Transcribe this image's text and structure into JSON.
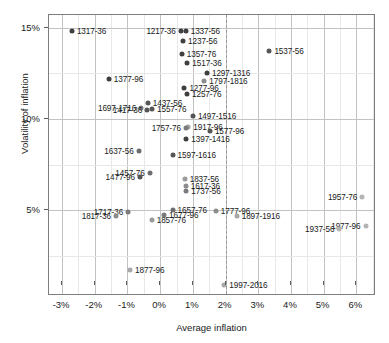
{
  "chart_data": {
    "type": "scatter",
    "title": "",
    "xlabel": "Average inflation",
    "ylabel": "Volatility of inflation",
    "xlim": [
      -3.4,
      6.6
    ],
    "ylim": [
      0.3,
      15.7
    ],
    "xticks": [
      "-3%",
      "-2%",
      "-1%",
      "0%",
      "1%",
      "2%",
      "3%",
      "4%",
      "5%",
      "6%"
    ],
    "xtick_values": [
      -3,
      -2,
      -1,
      0,
      1,
      2,
      3,
      4,
      5,
      6
    ],
    "yticks": [
      "5%",
      "10%",
      "15%"
    ],
    "ytick_values": [
      5,
      10,
      15
    ],
    "grid": true,
    "legend": "none",
    "reference_line": {
      "orientation": "vertical",
      "x": 2,
      "style": "dashed",
      "color": "#9a9a9a"
    },
    "colors": {
      "old_point": "#3f3f3f",
      "mid_point": "#6e6e6e",
      "modern_point": "#b4b4b4"
    },
    "points": [
      {
        "label": "1217-36",
        "x": 0.63,
        "y": 14.85,
        "color": "#3f3f3f",
        "size": 5.0,
        "side": "left"
      },
      {
        "label": "1337-56",
        "x": 0.78,
        "y": 14.85,
        "color": "#3f3f3f",
        "size": 5.0,
        "side": "right"
      },
      {
        "label": "1237-56",
        "x": 0.7,
        "y": 14.25,
        "color": "#3f3f3f",
        "size": 5.0,
        "side": "right"
      },
      {
        "label": "1317-36",
        "x": -2.7,
        "y": 14.85,
        "color": "#3f3f3f",
        "size": 5.0,
        "side": "right"
      },
      {
        "label": "1357-76",
        "x": 0.66,
        "y": 13.55,
        "color": "#3f3f3f",
        "size": 5.0,
        "side": "right"
      },
      {
        "label": "1537-56",
        "x": 3.34,
        "y": 13.75,
        "color": "#555555",
        "size": 5.0,
        "side": "right"
      },
      {
        "label": "1517-36",
        "x": 0.83,
        "y": 13.05,
        "color": "#3f3f3f",
        "size": 5.0,
        "side": "right"
      },
      {
        "label": "1297-1316",
        "x": 1.43,
        "y": 12.5,
        "color": "#3f3f3f",
        "size": 5.0,
        "side": "right"
      },
      {
        "label": "1377-96",
        "x": -1.57,
        "y": 12.2,
        "color": "#3f3f3f",
        "size": 5.0,
        "side": "right"
      },
      {
        "label": "1797-1816",
        "x": 1.35,
        "y": 12.1,
        "color": "#8c8c8c",
        "size": 5.0,
        "side": "right"
      },
      {
        "label": "1277-96",
        "x": 0.74,
        "y": 11.7,
        "color": "#3f3f3f",
        "size": 5.0,
        "side": "right"
      },
      {
        "label": "1257-76",
        "x": 0.82,
        "y": 11.35,
        "color": "#3f3f3f",
        "size": 5.0,
        "side": "right"
      },
      {
        "label": "1437-56",
        "x": -0.38,
        "y": 10.9,
        "color": "#555555",
        "size": 5.0,
        "side": "right"
      },
      {
        "label": "1697-1716",
        "x": -0.58,
        "y": 10.6,
        "color": "#7a7a7a",
        "size": 5.0,
        "side": "left"
      },
      {
        "label": "1557-76",
        "x": -0.25,
        "y": 10.55,
        "color": "#555555",
        "size": 5.0,
        "side": "right"
      },
      {
        "label": "1417-36",
        "x": -0.4,
        "y": 10.5,
        "color": "#555555",
        "size": 5.0,
        "side": "left"
      },
      {
        "label": "1497-1516",
        "x": 1.0,
        "y": 10.15,
        "color": "#555555",
        "size": 5.0,
        "side": "right"
      },
      {
        "label": "1917-96",
        "x": 0.86,
        "y": 9.58,
        "color": "#a0a0a0",
        "size": 5.0,
        "side": "right"
      },
      {
        "label": "1757-76",
        "x": 0.79,
        "y": 9.5,
        "color": "#7a7a7a",
        "size": 5.0,
        "side": "left"
      },
      {
        "label": "1577-96",
        "x": 1.52,
        "y": 9.35,
        "color": "#555555",
        "size": 5.0,
        "side": "right"
      },
      {
        "label": "1397-1416",
        "x": 0.8,
        "y": 8.9,
        "color": "#3f3f3f",
        "size": 5.0,
        "side": "right"
      },
      {
        "label": "1637-56",
        "x": -0.66,
        "y": 8.25,
        "color": "#6e6e6e",
        "size": 5.0,
        "side": "left"
      },
      {
        "label": "1597-1616",
        "x": 0.38,
        "y": 8.02,
        "color": "#555555",
        "size": 5.0,
        "side": "right"
      },
      {
        "label": "1457-76",
        "x": -0.32,
        "y": 7.05,
        "color": "#6e6e6e",
        "size": 5.0,
        "side": "left"
      },
      {
        "label": "1477-96",
        "x": -0.62,
        "y": 6.82,
        "color": "#555555",
        "size": 5.0,
        "side": "left"
      },
      {
        "label": "1837-56",
        "x": 0.75,
        "y": 6.7,
        "color": "#9a9a9a",
        "size": 5.0,
        "side": "right"
      },
      {
        "label": "1617-36",
        "x": 0.78,
        "y": 6.35,
        "color": "#8c8c8c",
        "size": 5.0,
        "side": "right"
      },
      {
        "label": "1737-56",
        "x": 0.8,
        "y": 6.08,
        "color": "#7a7a7a",
        "size": 5.0,
        "side": "right"
      },
      {
        "label": "1957-76",
        "x": 6.18,
        "y": 5.72,
        "color": "#b4b4b4",
        "size": 5.0,
        "side": "left"
      },
      {
        "label": "1717-36",
        "x": -0.98,
        "y": 4.92,
        "color": "#7a7a7a",
        "size": 5.0,
        "side": "left"
      },
      {
        "label": "1657-76",
        "x": 0.38,
        "y": 5.0,
        "color": "#6e6e6e",
        "size": 5.0,
        "side": "right"
      },
      {
        "label": "1777-96",
        "x": 1.7,
        "y": 4.98,
        "color": "#8c8c8c",
        "size": 5.0,
        "side": "right"
      },
      {
        "label": "1817-36",
        "x": -1.35,
        "y": 4.68,
        "color": "#8c8c8c",
        "size": 5.0,
        "side": "left"
      },
      {
        "label": "1677-96",
        "x": 0.12,
        "y": 4.75,
        "color": "#7a7a7a",
        "size": 5.0,
        "side": "right"
      },
      {
        "label": "1897-1916",
        "x": 2.34,
        "y": 4.7,
        "color": "#a8a8a8",
        "size": 5.0,
        "side": "right"
      },
      {
        "label": "1857-76",
        "x": -0.26,
        "y": 4.48,
        "color": "#9a9a9a",
        "size": 5.0,
        "side": "right"
      },
      {
        "label": "1977-96",
        "x": 6.28,
        "y": 4.15,
        "color": "#b4b4b4",
        "size": 5.0,
        "side": "left"
      },
      {
        "label": "1937-56",
        "x": 5.48,
        "y": 3.95,
        "color": "#b4b4b4",
        "size": 5.0,
        "side": "left"
      },
      {
        "label": "1877-96",
        "x": -0.92,
        "y": 1.7,
        "color": "#a8a8a8",
        "size": 5.0,
        "side": "right"
      },
      {
        "label": "1997-2016",
        "x": 1.96,
        "y": 0.92,
        "color": "#a8a8a8",
        "size": 5.0,
        "side": "right"
      }
    ]
  }
}
